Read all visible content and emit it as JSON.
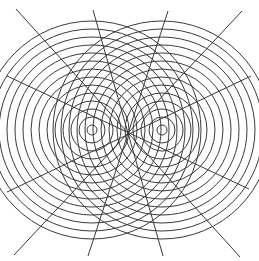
{
  "diagram": {
    "type": "two-source interference pattern",
    "background": "#ffffff",
    "stroke_color": "#3a3a3a",
    "sources": [
      {
        "cx": 92,
        "cy": 130
      },
      {
        "cx": 162,
        "cy": 130
      }
    ],
    "rings": {
      "r_start": 5,
      "r_step": 8,
      "count": 14
    },
    "radial_lines": [
      {
        "x1": 16,
        "y1": 9,
        "x2": 240,
        "y2": 257
      },
      {
        "x1": 93,
        "y1": 10,
        "x2": 163,
        "y2": 256
      },
      {
        "x1": 168,
        "y1": 11,
        "x2": 88,
        "y2": 256
      },
      {
        "x1": 242,
        "y1": 11,
        "x2": 14,
        "y2": 255
      },
      {
        "x1": 7,
        "y1": 76,
        "x2": 249,
        "y2": 189
      },
      {
        "x1": 7,
        "y1": 192,
        "x2": 251,
        "y2": 76
      }
    ]
  }
}
